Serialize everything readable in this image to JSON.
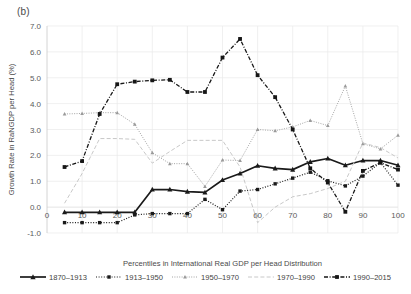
{
  "panel": {
    "label": "(b)"
  },
  "chart_data": {
    "type": "line",
    "title": "",
    "xlabel": "Percentiles in International Real GDP per Head Distribution",
    "ylabel": "Growth Rate in RaNGDP per Head (%)",
    "xlim": [
      0,
      100
    ],
    "ylim": [
      -1.0,
      7.0
    ],
    "xticks": [
      0,
      10,
      20,
      30,
      40,
      50,
      60,
      70,
      80,
      90,
      100
    ],
    "yticks": [
      -1.0,
      0.0,
      1.0,
      2.0,
      3.0,
      4.0,
      5.0,
      6.0,
      7.0
    ],
    "ytick_labels": [
      "-1.0",
      "0.0",
      "1.0",
      "2.0",
      "3.0",
      "4.0",
      "5.0",
      "6.0",
      "7.0"
    ],
    "xtick_labels": [
      "0",
      "10",
      "20",
      "30",
      "40",
      "50",
      "60",
      "70",
      "80",
      "90",
      "100"
    ],
    "grid": true,
    "legend_position": "bottom",
    "x": [
      5,
      10,
      15,
      20,
      25,
      30,
      35,
      40,
      45,
      50,
      55,
      60,
      65,
      70,
      75,
      80,
      85,
      90,
      95,
      100
    ],
    "series": [
      {
        "name": "1870–1913",
        "style": "solid-marker",
        "color": "#1a1a1a",
        "values": [
          -0.2,
          -0.2,
          -0.2,
          -0.2,
          -0.2,
          0.68,
          0.68,
          0.6,
          0.57,
          1.05,
          1.3,
          1.6,
          1.5,
          1.45,
          1.75,
          1.88,
          1.62,
          1.8,
          1.8,
          1.62
        ]
      },
      {
        "name": "1913–1950",
        "style": "dotted-marker",
        "color": "#1a1a1a",
        "values": [
          -0.6,
          -0.6,
          -0.6,
          -0.6,
          -0.3,
          -0.25,
          -0.25,
          -0.25,
          0.3,
          -0.1,
          0.62,
          0.68,
          0.9,
          1.12,
          1.35,
          1.02,
          0.82,
          1.2,
          1.72,
          0.85
        ]
      },
      {
        "name": "1950–1970",
        "style": "dashdot-light",
        "color": "#9a9a9a",
        "values": [
          3.6,
          3.62,
          3.65,
          3.65,
          3.2,
          2.1,
          1.68,
          1.68,
          0.8,
          1.82,
          1.8,
          3.0,
          2.95,
          3.1,
          3.35,
          3.15,
          4.68,
          2.45,
          2.25,
          2.78
        ]
      },
      {
        "name": "1970–1990",
        "style": "dashed-light",
        "color": "#c2c2c2",
        "values": [
          0.15,
          1.3,
          2.65,
          2.65,
          2.62,
          1.7,
          2.15,
          2.58,
          2.58,
          2.58,
          1.55,
          -0.6,
          0.0,
          0.4,
          0.52,
          0.72,
          1.0,
          2.48,
          2.3,
          1.9
        ]
      },
      {
        "name": "1990–2015",
        "style": "dashdotdot-bold",
        "color": "#161616",
        "values": [
          1.55,
          1.78,
          3.6,
          4.75,
          4.85,
          4.9,
          4.92,
          4.45,
          4.45,
          5.78,
          6.5,
          5.1,
          4.25,
          3.0,
          1.5,
          0.95,
          -0.18,
          1.4,
          1.72,
          1.45
        ]
      }
    ]
  },
  "legend": {
    "items": [
      {
        "label": "1870–1913"
      },
      {
        "label": "1913–1950"
      },
      {
        "label": "1950–1970"
      },
      {
        "label": "1970–1990"
      },
      {
        "label": "1990–2015"
      }
    ]
  }
}
